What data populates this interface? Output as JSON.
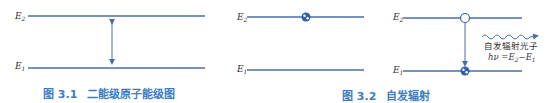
{
  "colors": {
    "level_line": "#4a6ea8",
    "caption": "#3b7dc4",
    "text": "#333333"
  },
  "figure1": {
    "upper_level": "E",
    "upper_sub": "2",
    "lower_level": "E",
    "lower_sub": "1",
    "caption_num": "图 3.1",
    "caption_text": "二能级原子能级图"
  },
  "figure2": {
    "left": {
      "upper_level": "E",
      "upper_sub": "2",
      "lower_level": "E",
      "lower_sub": "1"
    },
    "right": {
      "upper_level": "E",
      "upper_sub": "2",
      "lower_level": "E",
      "lower_sub": "1"
    },
    "photon_label": "自发辐射光子",
    "photon_eq_h": "hν",
    "photon_eq_rest": " =E",
    "photon_eq_s2": "2",
    "photon_eq_mid": "−E",
    "photon_eq_s1": "1",
    "caption_num": "图 3.2",
    "caption_text": "自发辐射"
  }
}
